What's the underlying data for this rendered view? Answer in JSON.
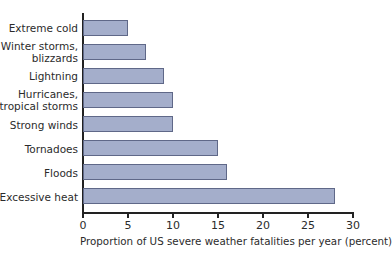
{
  "chart_data": {
    "type": "bar",
    "orientation": "horizontal",
    "title": "",
    "xlabel": "Proportion of US severe weather fatalities per year (percent)",
    "ylabel": "",
    "xlim": [
      0,
      30
    ],
    "xticks": [
      0,
      5,
      10,
      15,
      20,
      25,
      30
    ],
    "grid": false,
    "legend": null,
    "categories": [
      "Extreme cold",
      "Winter storms,\nblizzards",
      "Lightning",
      "Hurricanes,\ntropical storms",
      "Strong winds",
      "Tornadoes",
      "Floods",
      "Excessive heat"
    ],
    "values": [
      5,
      7,
      9,
      10,
      10,
      15,
      16,
      28
    ],
    "colors": {
      "bar_fill": "#a4aecb",
      "bar_border": "#5f6888",
      "axis": "#222222"
    }
  },
  "labels": {
    "cat0_l1": "Extreme cold",
    "cat1_l1": "Winter storms,",
    "cat1_l2": "blizzards",
    "cat2_l1": "Lightning",
    "cat3_l1": "Hurricanes,",
    "cat3_l2": "tropical storms",
    "cat4_l1": "Strong winds",
    "cat5_l1": "Tornadoes",
    "cat6_l1": "Floods",
    "cat7_l1": "Excessive heat"
  },
  "ticks": [
    "0",
    "5",
    "10",
    "15",
    "20",
    "25",
    "30"
  ]
}
